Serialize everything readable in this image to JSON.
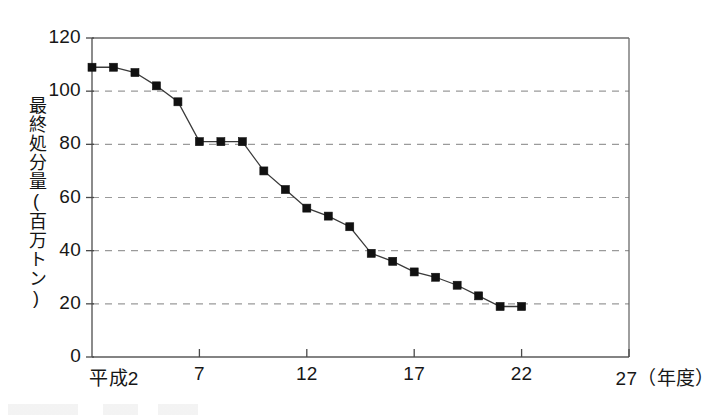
{
  "chart_data": {
    "type": "line",
    "title": "",
    "xlabel": "平成2 〜 27（年度）",
    "ylabel": "最終処分量（百万トン）",
    "ylim": [
      0,
      120
    ],
    "ytick_values": [
      0,
      20,
      40,
      60,
      80,
      100,
      120
    ],
    "ytick_labels": [
      "0",
      "20",
      "40",
      "60",
      "80",
      "100",
      "120"
    ],
    "xlim": [
      2,
      27
    ],
    "xtick_values": [
      2,
      7,
      12,
      17,
      22,
      27
    ],
    "xtick_labels": [
      "平成2",
      "7",
      "12",
      "17",
      "22",
      "27（年度）"
    ],
    "grid": "horizontal-dashed",
    "legend": "none",
    "x": [
      2,
      3,
      4,
      5,
      6,
      7,
      8,
      9,
      10,
      11,
      12,
      13,
      14,
      15,
      16,
      17,
      18,
      19,
      20,
      21,
      22
    ],
    "values": [
      109,
      109,
      107,
      102,
      96,
      81,
      81,
      81,
      70,
      63,
      56,
      53,
      49,
      39,
      36,
      32,
      30,
      27,
      23,
      19,
      19
    ],
    "series": [
      {
        "name": "最終処分量",
        "marker": "square",
        "color": "#111111",
        "values": [
          109,
          109,
          107,
          102,
          96,
          81,
          81,
          81,
          70,
          63,
          56,
          53,
          49,
          39,
          36,
          32,
          30,
          27,
          23,
          19,
          19
        ]
      }
    ]
  },
  "axis": {
    "y_title": "最終処分量(百万トン)",
    "y_labels": [
      "120",
      "100",
      "80",
      "60",
      "40",
      "20",
      "0"
    ],
    "x_labels": [
      "平成2",
      "7",
      "12",
      "17",
      "22",
      "27(年度)"
    ]
  },
  "colors": {
    "line": "#3a3a3a",
    "marker": "#111111",
    "grid": "#9a9a9a",
    "axis": "#5a5a5a",
    "background": "#ffffff"
  }
}
